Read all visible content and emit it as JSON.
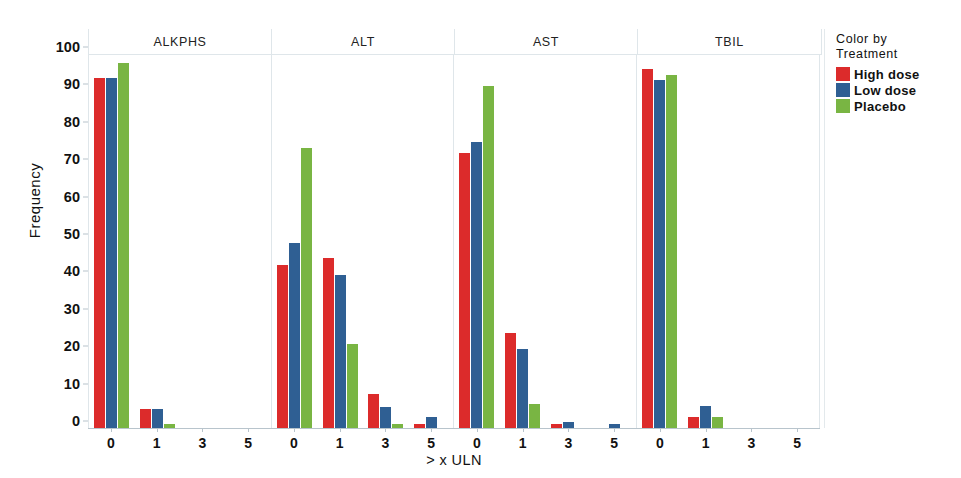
{
  "chart_data": {
    "type": "bar",
    "title": "",
    "xlabel": "> x ULN",
    "ylabel": "Frequency",
    "ylim": [
      0,
      100
    ],
    "yticks": [
      0,
      10,
      20,
      30,
      40,
      50,
      60,
      70,
      80,
      90,
      100
    ],
    "categories": [
      "0",
      "1",
      "3",
      "5"
    ],
    "grid": false,
    "legend_position": "right",
    "legend_title_lines": [
      "Color by",
      "Treatment"
    ],
    "series_colors": {
      "High dose": "#dc2b2b",
      "Low dose": "#2f5f93",
      "Placebo": "#79b543"
    },
    "panels": [
      {
        "label": "ALKPHS",
        "series": [
          {
            "name": "High dose",
            "color": "#dc2b2b",
            "values": [
              93.5,
              5,
              0,
              0
            ]
          },
          {
            "name": "Low dose",
            "color": "#2f5f93",
            "values": [
              93.5,
              5,
              0,
              0
            ]
          },
          {
            "name": "Placebo",
            "color": "#79b543",
            "values": [
              97.5,
              1,
              0,
              0
            ]
          }
        ]
      },
      {
        "label": "ALT",
        "series": [
          {
            "name": "High dose",
            "color": "#dc2b2b",
            "values": [
              43.5,
              45.5,
              9,
              1
            ]
          },
          {
            "name": "Low dose",
            "color": "#2f5f93",
            "values": [
              49.5,
              41,
              5.5,
              3
            ]
          },
          {
            "name": "Placebo",
            "color": "#79b543",
            "values": [
              75,
              22.5,
              1,
              0
            ]
          }
        ]
      },
      {
        "label": "AST",
        "series": [
          {
            "name": "High dose",
            "color": "#dc2b2b",
            "values": [
              73.5,
              25.5,
              1,
              0
            ]
          },
          {
            "name": "Low dose",
            "color": "#2f5f93",
            "values": [
              76.5,
              21,
              1.5,
              1
            ]
          },
          {
            "name": "Placebo",
            "color": "#79b543",
            "values": [
              91.5,
              6.5,
              0,
              0
            ]
          }
        ]
      },
      {
        "label": "TBIL",
        "series": [
          {
            "name": "High dose",
            "color": "#dc2b2b",
            "values": [
              96,
              3,
              0,
              0
            ]
          },
          {
            "name": "Low dose",
            "color": "#2f5f93",
            "values": [
              93,
              6,
              0,
              0
            ]
          },
          {
            "name": "Placebo",
            "color": "#79b543",
            "values": [
              94.5,
              3,
              0,
              0
            ]
          }
        ]
      }
    ]
  },
  "legend": {
    "title_line_1": "Color by",
    "title_line_2": "Treatment",
    "items": [
      {
        "label": "High dose",
        "color": "#dc2b2b"
      },
      {
        "label": "Low dose",
        "color": "#2f5f93"
      },
      {
        "label": "Placebo",
        "color": "#79b543"
      }
    ]
  },
  "axes": {
    "y_title": "Frequency",
    "x_title": "> x ULN"
  }
}
